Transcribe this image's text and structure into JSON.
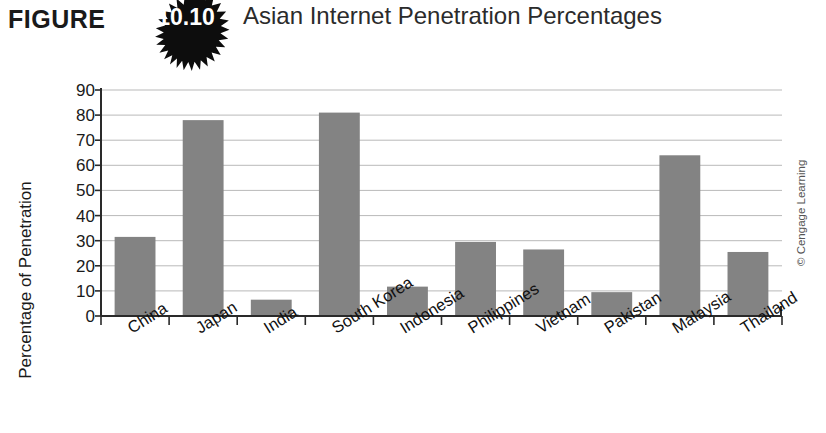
{
  "figure": {
    "label": "FIGURE",
    "number": "10.10",
    "title": "Asian Internet Penetration Percentages",
    "badge_icon": "starburst-badge-icon",
    "badge_color": "#0d0d0d"
  },
  "credit": {
    "text": "© Cengage Learning"
  },
  "chart_data": {
    "type": "bar",
    "title": "Asian Internet Penetration Percentages",
    "xlabel": "",
    "ylabel": "Percentage of Penetration",
    "ylim": [
      0,
      90
    ],
    "ytick_step": 10,
    "yticks": [
      "90",
      "80",
      "70",
      "60",
      "50",
      "40",
      "30",
      "20",
      "10",
      "0"
    ],
    "grid": true,
    "legend": "none",
    "bar_color": "#838383",
    "categories": [
      "China",
      "Japan",
      "India",
      "South Korea",
      "Indonesia",
      "Philippines",
      "Vietnam",
      "Pakistan",
      "Malaysia",
      "Thailand"
    ],
    "values": [
      31.5,
      78,
      6.5,
      81,
      11.7,
      29.5,
      26.5,
      9.5,
      64,
      25.5
    ]
  }
}
